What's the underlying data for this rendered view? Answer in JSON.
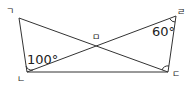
{
  "vertices": {
    "top_left": "ㄱ",
    "bottom_left": "ㄴ",
    "bottom_right": "ㄷ",
    "top_right": "ㄹ",
    "intersection": "ㅁ"
  },
  "angles": {
    "at_bottom_left": "100°",
    "at_top_right": "60°"
  },
  "colors": {
    "line": "#333333"
  }
}
